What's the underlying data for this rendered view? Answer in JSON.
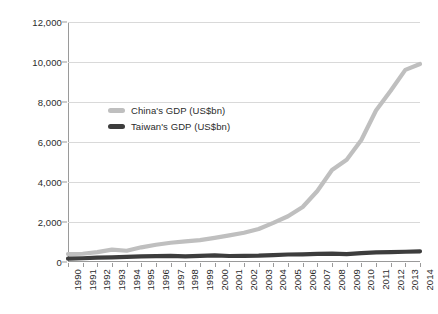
{
  "chart_data": {
    "type": "line",
    "title": "",
    "xlabel": "",
    "ylabel": "",
    "x": [
      1990,
      1991,
      1992,
      1993,
      1994,
      1995,
      1996,
      1997,
      1998,
      1999,
      2000,
      2001,
      2002,
      2003,
      2004,
      2005,
      2006,
      2007,
      2008,
      2009,
      2010,
      2011,
      2012,
      2013,
      2014
    ],
    "categories": [
      "1990",
      "1991",
      "1992",
      "1993",
      "1994",
      "1995",
      "1996",
      "1997",
      "1998",
      "1999",
      "2000",
      "2001",
      "2002",
      "2003",
      "2004",
      "2005",
      "2006",
      "2007",
      "2008",
      "2009",
      "2010",
      "2011",
      "2012",
      "2013",
      "2014"
    ],
    "series": [
      {
        "name": "China's GDP (US$bn)",
        "color": "#bfbfbf",
        "values": [
          398,
          413,
          493,
          619,
          564,
          734,
          863,
          962,
          1029,
          1094,
          1205,
          1332,
          1461,
          1650,
          1955,
          2286,
          2752,
          3552,
          4598,
          5110,
          6101,
          7573,
          8560,
          9607,
          9900
        ]
      },
      {
        "name": "Taiwan's GDP (US$bn)",
        "color": "#3d3d3d",
        "values": [
          166,
          187,
          222,
          235,
          256,
          279,
          292,
          303,
          280,
          303,
          331,
          299,
          307,
          318,
          347,
          374,
          386,
          406,
          415,
          392,
          444,
          485,
          496,
          512,
          530
        ]
      }
    ],
    "yticks": [
      0,
      2000,
      4000,
      6000,
      8000,
      10000,
      12000
    ],
    "ytick_labels": [
      "0",
      "2,000",
      "4,000",
      "6,000",
      "8,000",
      "10,000",
      "12,000"
    ],
    "ylim": [
      0,
      12000
    ],
    "xlim": [
      1990,
      2014
    ],
    "grid": true,
    "legend_position": "inside-upper-left"
  }
}
